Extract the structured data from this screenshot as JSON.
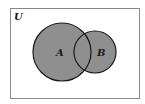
{
  "diagram": {
    "type": "venn",
    "universe": {
      "label": "U",
      "x": 10,
      "y": 8,
      "width": 129,
      "height": 90,
      "stroke": "#8a8a8a"
    },
    "sets": [
      {
        "label": "A",
        "cx": 62,
        "cy": 52,
        "r": 29,
        "fill": "#8f8f8f",
        "stroke": "#1a1a1a",
        "label_x": 59,
        "label_y": 56
      },
      {
        "label": "B",
        "cx": 95,
        "cy": 52,
        "r": 21,
        "fill": "#8f8f8f",
        "stroke": "#1a1a1a",
        "label_x": 101,
        "label_y": 56
      }
    ],
    "shaded_region": "A ∪ B"
  }
}
